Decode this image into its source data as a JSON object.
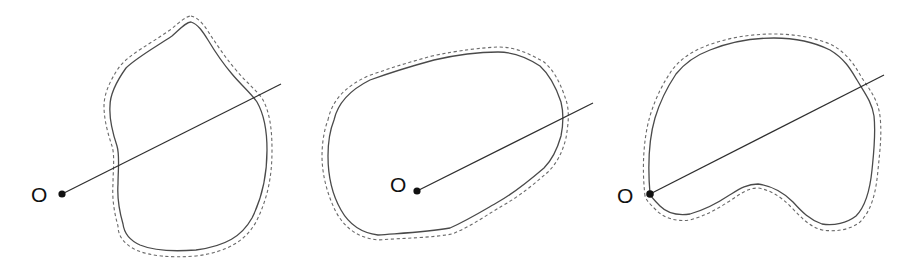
{
  "figure": {
    "panels": [
      {
        "id": "panel-1",
        "description": "Origin O outside the region; ray from O crosses the boundary twice",
        "origin_label": "O",
        "origin": [
          62,
          194
        ],
        "label_pos": [
          31,
          202
        ],
        "ray_end": [
          281,
          84
        ]
      },
      {
        "id": "panel-2",
        "description": "Origin O inside the region; ray from O crosses the boundary once",
        "origin_label": "O",
        "origin": [
          417,
          191
        ],
        "label_pos": [
          390,
          192
        ],
        "ray_end": [
          593,
          103
        ]
      },
      {
        "id": "panel-3",
        "description": "Origin O on the boundary of the region; ray from O crosses the boundary",
        "origin_label": "O",
        "origin": [
          650,
          194
        ],
        "label_pos": [
          617,
          203
        ],
        "ray_end": [
          884,
          75
        ]
      }
    ],
    "colors": {
      "outline": "#4a4a4a",
      "dashed_outline": "#6a6a6a",
      "ray": "#2e2e2e",
      "dot": "#111111",
      "background": "#ffffff"
    }
  }
}
